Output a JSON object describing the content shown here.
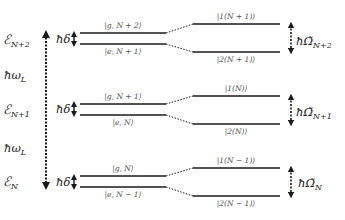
{
  "diagram": {
    "type": "energy-level-diagram",
    "colors": {
      "line": "#1a1a1a",
      "text": "#222222",
      "label": "#555555",
      "background": "#ffffff"
    },
    "left_axis": {
      "energies": [
        {
          "main": "ℰ",
          "sub": "N+2"
        },
        {
          "main": "ℰ",
          "sub": "N+1"
        },
        {
          "main": "ℰ",
          "sub": "N"
        }
      ],
      "spacings": [
        {
          "label": "ħω",
          "sub": "L"
        },
        {
          "label": "ħω",
          "sub": "L"
        }
      ]
    },
    "manifolds": [
      {
        "detuning_label": "ħδ",
        "bare_upper": "|g, N + 2⟩",
        "bare_lower": "|e, N + 1⟩",
        "dressed_upper": "|1(N + 1)⟩",
        "dressed_lower": "|2(N + 1)⟩",
        "splitting_main": "ħΩ̃",
        "splitting_sub": "N+2"
      },
      {
        "detuning_label": "ħδ",
        "bare_upper": "|g, N + 1⟩",
        "bare_lower": "|e, N⟩",
        "dressed_upper": "|1(N)⟩",
        "dressed_lower": "|2(N)⟩",
        "splitting_main": "ħΩ̃",
        "splitting_sub": "N+1"
      },
      {
        "detuning_label": "ħδ",
        "bare_upper": "|g, N⟩",
        "bare_lower": "|e, N − 1⟩",
        "dressed_upper": "|1(N − 1)⟩",
        "dressed_lower": "|2(N − 1)⟩",
        "splitting_main": "ħΩ̃",
        "splitting_sub": "N"
      }
    ]
  }
}
